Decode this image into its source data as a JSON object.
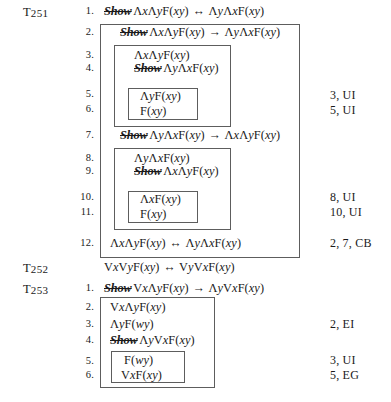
{
  "page": {
    "width": 391,
    "height": 402,
    "background": "#ffffff",
    "ink": "#1a1a1a",
    "box_border": "#5d5d5d"
  },
  "theorems": [
    {
      "id": "T251",
      "label": "T251",
      "statement_inline": false,
      "lines": [
        {
          "no": "1.",
          "text": "Show ΛxΛyF(xy) ↔ ΛyΛxF(xy)",
          "show": true,
          "annotation": ""
        },
        {
          "no": "2.",
          "text": "Show ΛxΛyF(xy) → ΛyΛxF(xy)",
          "show": true,
          "annotation": ""
        },
        {
          "no": "3.",
          "text": "ΛxΛyF(xy)",
          "show": false,
          "annotation": ""
        },
        {
          "no": "4.",
          "text": "Show ΛyΛxF(xy)",
          "show": true,
          "annotation": ""
        },
        {
          "no": "5.",
          "text": "ΛyF(xy)",
          "show": false,
          "annotation": "3, UI"
        },
        {
          "no": "6.",
          "text": "F(xy)",
          "show": false,
          "annotation": "5, UI"
        },
        {
          "no": "7.",
          "text": "Show ΛyΛxF(xy) → ΛxΛyF(xy)",
          "show": true,
          "annotation": ""
        },
        {
          "no": "8.",
          "text": "ΛyΛxF(xy)",
          "show": false,
          "annotation": ""
        },
        {
          "no": "9.",
          "text": "Show ΛxΛyF(xy)",
          "show": true,
          "annotation": ""
        },
        {
          "no": "10.",
          "text": "ΛxF(xy)",
          "show": false,
          "annotation": "8, UI"
        },
        {
          "no": "11.",
          "text": "F(xy)",
          "show": false,
          "annotation": "10, UI"
        },
        {
          "no": "12.",
          "text": "ΛxΛyF(xy) ↔ ΛyΛxF(xy)",
          "show": false,
          "annotation": "2, 7, CB"
        }
      ]
    },
    {
      "id": "T252",
      "label": "T252",
      "statement_inline": true,
      "statement": "VxVyF(xy) ↔ VyVxF(xy)",
      "lines": []
    },
    {
      "id": "T253",
      "label": "T253",
      "statement_inline": false,
      "lines": [
        {
          "no": "1.",
          "text": "Show VxΛyF(xy) → ΛyVxF(xy)",
          "show": true,
          "annotation": ""
        },
        {
          "no": "2.",
          "text": "VxΛyF(xy)",
          "show": false,
          "annotation": ""
        },
        {
          "no": "3.",
          "text": "ΛyF(wy)",
          "show": false,
          "annotation": "2, EI"
        },
        {
          "no": "4.",
          "text": "Show ΛyVxF(xy)",
          "show": true,
          "annotation": ""
        },
        {
          "no": "5.",
          "text": "F(wy)",
          "show": false,
          "annotation": "3, UI"
        },
        {
          "no": "6.",
          "text": "VxF(xy)",
          "show": false,
          "annotation": "5, EG"
        }
      ]
    }
  ],
  "annotations_list": [
    {
      "for_line": "5",
      "text": "3, UI"
    },
    {
      "for_line": "6",
      "text": "5, UI"
    },
    {
      "for_line": "10",
      "text": "8, UI"
    },
    {
      "for_line": "11",
      "text": "10, UI"
    },
    {
      "for_line": "12",
      "text": "2, 7, CB"
    },
    {
      "for_line": "t253-3",
      "text": "2, EI"
    },
    {
      "for_line": "t253-5",
      "text": "3, UI"
    },
    {
      "for_line": "t253-6",
      "text": "5, EG"
    }
  ],
  "symbols": {
    "universal": "Λ",
    "existential": "V",
    "biconditional": "↔",
    "conditional": "→",
    "predicate": "F",
    "show_keyword": "Show"
  },
  "rules_used": [
    "UI",
    "EI",
    "EG",
    "CB"
  ]
}
